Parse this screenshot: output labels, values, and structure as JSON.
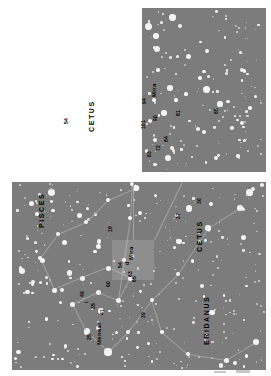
{
  "figure": {
    "kind": "star-chart",
    "orientation": "rotated-90",
    "background_color": "#ffffff",
    "sky_color": "#7c7c7c",
    "star_color": "#f4f4f4",
    "constellation_line_color": "#a8a8a8",
    "panel_count": 2
  },
  "panels": [
    {
      "id": "detail",
      "name": "detail-panel",
      "role": "magnified finder chart around Mira",
      "constellation_labels": [
        {
          "text": "CETUS",
          "x": 88,
          "y": 132
        }
      ],
      "star_labels": [
        {
          "text": "54",
          "x": 63,
          "y": 124
        },
        {
          "text": "63",
          "x": 146,
          "y": 157
        },
        {
          "text": "101",
          "x": 140,
          "y": 129
        },
        {
          "text": "90",
          "x": 152,
          "y": 121
        },
        {
          "text": "94",
          "x": 141,
          "y": 104
        },
        {
          "text": "Mira",
          "x": 151,
          "y": 97
        },
        {
          "text": "72",
          "x": 155,
          "y": 151
        },
        {
          "text": "84",
          "x": 163,
          "y": 142
        },
        {
          "text": "81",
          "x": 175,
          "y": 116
        },
        {
          "text": "65",
          "x": 213,
          "y": 114
        }
      ]
    },
    {
      "id": "wide",
      "name": "wide-field-panel",
      "role": "wide field chart of Cetus, Pisces and Eridanus",
      "constellation_labels": [
        {
          "text": "PISCES",
          "x": 38,
          "y": 228
        },
        {
          "text": "CETUS",
          "x": 196,
          "y": 252
        },
        {
          "text": "ERIDANUS",
          "x": 203,
          "y": 345
        }
      ],
      "star_labels": [
        {
          "text": "Menkar",
          "x": 96,
          "y": 345
        },
        {
          "text": "25",
          "x": 86,
          "y": 340
        },
        {
          "text": "35",
          "x": 90,
          "y": 309
        },
        {
          "text": "41",
          "x": 99,
          "y": 315
        },
        {
          "text": "49",
          "x": 79,
          "y": 297
        },
        {
          "text": "t",
          "x": 83,
          "y": 303
        },
        {
          "text": "60",
          "x": 105,
          "y": 287
        },
        {
          "text": "54",
          "x": 117,
          "y": 268
        },
        {
          "text": "63",
          "x": 127,
          "y": 277
        },
        {
          "text": "65",
          "x": 131,
          "y": 282
        },
        {
          "text": "Mira",
          "x": 128,
          "y": 260
        },
        {
          "text": "d",
          "x": 124,
          "y": 265
        },
        {
          "text": "18",
          "x": 107,
          "y": 232
        },
        {
          "text": "39",
          "x": 140,
          "y": 318
        },
        {
          "text": "37",
          "x": 175,
          "y": 219
        },
        {
          "text": "36",
          "x": 196,
          "y": 204
        }
      ]
    }
  ],
  "legend": {
    "note": ""
  }
}
